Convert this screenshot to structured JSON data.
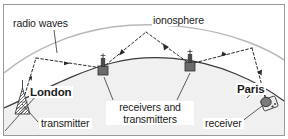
{
  "figure": {
    "type": "diagram",
    "colors": {
      "frame_border": "#9a9a9a",
      "earth_line": "#3a3a3a",
      "earth_fill": "#f0f0f0",
      "ionosphere_line": "#b8b8b8",
      "wave_path": "#2b2b2b",
      "leader_line": "#4a4a4a",
      "tower_body": "#6b6b6b",
      "tower_dark": "#2e2e2e",
      "text": "#1b1b1b",
      "background": "#ffffff"
    }
  },
  "labels": {
    "radio_waves": "radio waves",
    "ionosphere": "ionosphere",
    "london": "London",
    "transmitter": "transmitter",
    "receivers_and_transmitters": "receivers and transmitters",
    "paris": "Paris",
    "receiver": "receiver"
  },
  "elements": {
    "ionosphere_arc": "ionosphere-arc",
    "earth_surface_arc": "earth-surface-arc",
    "wave_path": "radio-wave-dashed-path",
    "london_transmitter_tower": "lattice-transmitter-tower",
    "relay_station_1": "relay-receiver-transmitter-tower",
    "relay_station_2": "relay-receiver-transmitter-tower",
    "paris_receiver_dish": "satellite-dish-receiver"
  }
}
